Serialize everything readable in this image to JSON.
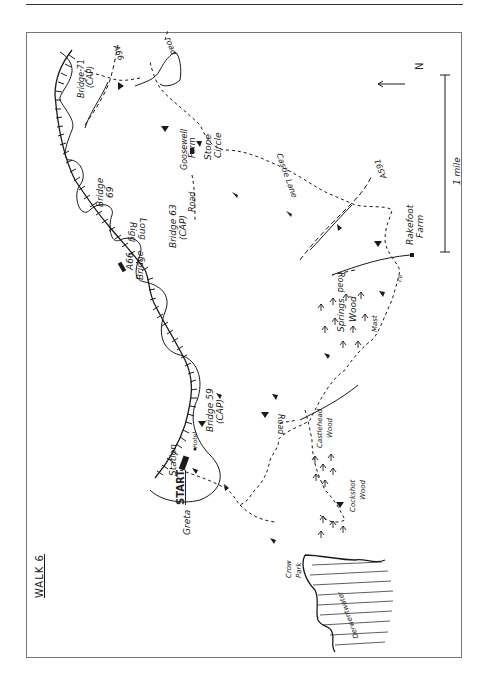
{
  "page": {
    "title": "WALK 6"
  },
  "map": {
    "north_label": "N",
    "scale_label": "1 mile",
    "labels": {
      "start": "START",
      "station": "Station",
      "hotel": "Hotel",
      "greta": "Greta",
      "bridge59": "Bridge 59",
      "bridge59_sub": "(CAP)",
      "a66_bridge_line1": "A66",
      "a66_bridge_line2": "Bridge",
      "bridge63": "Bridge 63",
      "bridge63_sub": "(CAP)",
      "long_rigg_line1": "Long",
      "long_rigg_line2": "Rigg",
      "bridge69_line1": "Bridge",
      "bridge69_line2": "69",
      "bridge71": "Bridge 71",
      "bridge71_sub": "(CAP)",
      "a66_road": "A66",
      "road_top": "road",
      "goosewell_line1": "Goosewell",
      "goosewell_line2": "Farm",
      "stone_circle_line1": "Stone",
      "stone_circle_line2": "Circle",
      "road_mid": "Road",
      "castle_lane": "Castle Lane",
      "a591": "A591",
      "rakefoot_line1": "Rakefoot",
      "rakefoot_line2": "Farm",
      "road_right": "Road",
      "fb": "F.B",
      "springs_wood_line1": "Springs",
      "springs_wood_line2": "Wood",
      "mast": "Mast",
      "castlehead_line1": "Castlehead",
      "castlehead_line2": "Wood",
      "road_lower": "Road",
      "cockshot_line1": "Cockshot",
      "cockshot_line2": "Wood",
      "crow_park_line1": "Crow",
      "crow_park_line2": "Park",
      "derwentwater": "Derwentwater"
    },
    "colors": {
      "ink": "#1a1a1a",
      "frame": "#777777",
      "paper": "#ffffff"
    }
  }
}
